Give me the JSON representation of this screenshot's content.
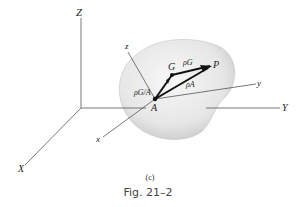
{
  "figure": {
    "panel_label": "(c)",
    "caption": "Fig. 21–2"
  },
  "axes": {
    "fixed": {
      "X": "X",
      "Y": "Y",
      "Z": "Z"
    },
    "body": {
      "x": "x",
      "y": "y",
      "z": "z"
    }
  },
  "points": {
    "A": "A",
    "G": "G",
    "P": "P"
  },
  "vectors": {
    "rho_G": "ρG",
    "rho_A": "ρA",
    "rho_G_A": "ρG/A"
  }
}
